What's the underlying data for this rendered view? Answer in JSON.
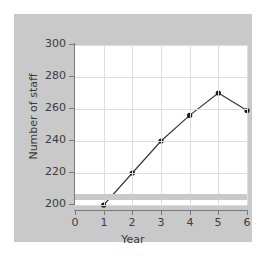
{
  "chart_data": {
    "type": "line",
    "title": "",
    "xlabel": "Year",
    "ylabel": "Number of staff",
    "x": [
      1,
      2,
      3,
      4,
      5,
      6
    ],
    "values": [
      200,
      220,
      240,
      256,
      270,
      259
    ],
    "series": [
      {
        "name": "Number of staff",
        "values": [
          200,
          220,
          240,
          256,
          270,
          259
        ]
      }
    ],
    "xlim": [
      0,
      6
    ],
    "ylim": [
      200,
      300
    ],
    "x_ticks": [
      0,
      1,
      2,
      3,
      4,
      5,
      6
    ],
    "y_ticks": [
      200,
      220,
      240,
      260,
      280,
      300
    ],
    "x_tick_labels": [
      "0",
      "1",
      "2",
      "3",
      "4",
      "5",
      "6"
    ],
    "y_tick_labels": [
      "200",
      "220",
      "240",
      "260",
      "280",
      "300"
    ],
    "grid": true,
    "legend": false,
    "axis_break": true,
    "marker": "circle",
    "line_color": "#3b3b3b",
    "marker_color": "#1a1a1a",
    "grid_color": "#dedede",
    "figure_background": "#c9c9c9",
    "plot_background": "#ffffff"
  }
}
